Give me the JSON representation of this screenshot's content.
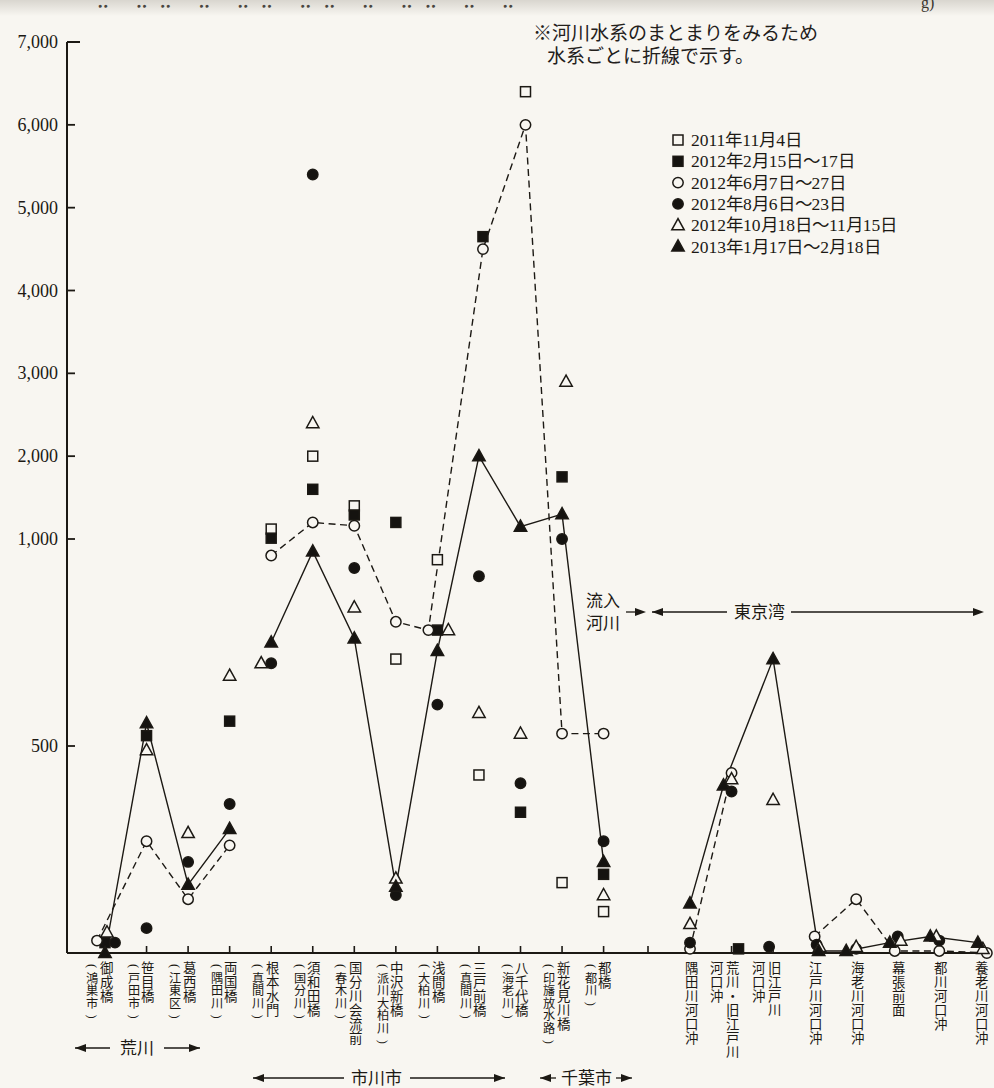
{
  "page": {
    "top_cropped_fragment_legible": "g)",
    "top_cropped_fragment_smudge": "⠤ ⠤⠤ ⠤ ⠤⠤ ⠤⠤ ⠤ ⠤⠤ ⠤ ⠤",
    "paper_color": "#f8f6f1",
    "ink_color": "#1c1914"
  },
  "note": {
    "line1": "※河川水系のまとまりをみるため",
    "line2": "水系ごとに折線で示す。"
  },
  "legend": {
    "items": [
      {
        "marker": "square-open-icon",
        "series": "sq_open",
        "label": "2011年11月4日"
      },
      {
        "marker": "square-filled-icon",
        "series": "sq_fill",
        "label": "2012年2月15日〜17日"
      },
      {
        "marker": "circle-open-icon",
        "series": "ci_open",
        "label": "2012年6月7日〜27日"
      },
      {
        "marker": "circle-filled-icon",
        "series": "ci_fill",
        "label": "2012年8月6日〜23日"
      },
      {
        "marker": "triangle-open-icon",
        "series": "tr_open",
        "label": "2012年10月18日〜11月15日"
      },
      {
        "marker": "triangle-filled-icon",
        "series": "tr_fill",
        "label": "2013年1月17日〜2月18日"
      }
    ]
  },
  "regions": {
    "arakawa": "荒川",
    "ichikawa_city": "市川市",
    "chiba_city": "千葉市",
    "inflow_line1": "流入",
    "inflow_line2": "河川",
    "tokyo_bay": "東京湾"
  },
  "chart_data": {
    "type": "scatter",
    "y_axis": {
      "ticks": [
        {
          "v": 7000,
          "label": "7,000"
        },
        {
          "v": 6000,
          "label": "6,000"
        },
        {
          "v": 5000,
          "label": "5,000"
        },
        {
          "v": 4000,
          "label": "4,000"
        },
        {
          "v": 3000,
          "label": "3,000"
        },
        {
          "v": 2000,
          "label": "2,000"
        },
        {
          "v": 1000,
          "label": "1,000"
        },
        {
          "v": 500,
          "label": "500"
        }
      ],
      "scale_note": "nonuniform: region below 1,000 is expanded",
      "ylim": [
        0,
        7000
      ],
      "grid": false
    },
    "series": [
      {
        "key": "sq_open",
        "marker": "square",
        "fill": "open",
        "label": "2011年11月4日"
      },
      {
        "key": "sq_fill",
        "marker": "square",
        "fill": "filled",
        "label": "2012年2月15日〜17日"
      },
      {
        "key": "ci_open",
        "marker": "circle",
        "fill": "open",
        "label": "2012年6月7日〜27日",
        "line": "dashed"
      },
      {
        "key": "ci_fill",
        "marker": "circle",
        "fill": "filled",
        "label": "2012年8月6日〜23日"
      },
      {
        "key": "tr_open",
        "marker": "triangle",
        "fill": "open",
        "label": "2012年10月18日〜11月15日"
      },
      {
        "key": "tr_fill",
        "marker": "triangle",
        "fill": "filled",
        "label": "2013年1月17日〜2月18日",
        "line": "solid"
      }
    ],
    "stations": [
      {
        "name": "御成橋",
        "sub": "(鴻巣市)",
        "v": {
          "sq_fill": 25,
          "ci_open": 30,
          "ci_fill": 25,
          "tr_open": 50,
          "tr_fill": 0
        },
        "dx": {
          "ci_open": -8,
          "ci_fill": 10,
          "tr_open": 2
        }
      },
      {
        "name": "笹目橋",
        "sub": "(戸田市)",
        "v": {
          "sq_fill": 525,
          "ci_open": 270,
          "ci_fill": 60,
          "tr_open": 490,
          "tr_fill": 555
        }
      },
      {
        "name": "葛西橋",
        "sub": "(江東区)",
        "v": {
          "ci_open": 130,
          "ci_fill": 220,
          "tr_open": 290,
          "tr_fill": 165
        }
      },
      {
        "name": "両国橋",
        "sub": "(隅田川)",
        "v": {
          "sq_fill": 560,
          "ci_open": 260,
          "ci_fill": 360,
          "tr_open": 670,
          "tr_fill": 300
        }
      },
      {
        "name": "根本水門",
        "sub": "(真間川)",
        "v": {
          "sq_open": 1120,
          "sq_fill": 1010,
          "ci_open": 960,
          "ci_fill": 700,
          "tr_open": 700,
          "tr_fill": 750
        },
        "dx": {
          "tr_open": -10
        }
      },
      {
        "name": "須和田橋",
        "sub": "(国分川)",
        "v": {
          "sq_open": 2000,
          "sq_fill": 1600,
          "ci_open": 1200,
          "ci_fill": 5400,
          "tr_open": 2400,
          "tr_fill": 970
        }
      },
      {
        "name": "国分川会流前",
        "sub": "(春木川)",
        "v": {
          "sq_open": 1400,
          "sq_fill": 1290,
          "ci_open": 1160,
          "ci_fill": 930,
          "tr_open": 835,
          "tr_fill": 760
        }
      },
      {
        "name": "中沢新橋",
        "sub": "(派川大柏川)",
        "v": {
          "sq_open": 710,
          "sq_fill": 1200,
          "ci_open": 800,
          "ci_fill": 140,
          "tr_open": 180,
          "tr_fill": 160
        }
      },
      {
        "name": "浅間橋",
        "sub": "(大柏川)",
        "v": {
          "sq_open": 950,
          "sq_fill": 780,
          "ci_open": 780,
          "ci_fill": 600,
          "tr_open": 780,
          "tr_fill": 730
        },
        "dx": {
          "ci_open": -9,
          "tr_open": 11
        }
      },
      {
        "name": "三戸前橋",
        "sub": "(真間川)",
        "v": {
          "sq_open": 430,
          "sq_fill": 4650,
          "ci_open": 4500,
          "ci_fill": 910,
          "tr_open": 580,
          "tr_fill": 2000
        },
        "dx": {
          "sq_fill": 4,
          "ci_open": 4
        }
      },
      {
        "name": "八千代橋",
        "sub": "(海老川)",
        "v": {
          "sq_open": 6400,
          "sq_fill": 340,
          "ci_open": 6000,
          "ci_fill": 410,
          "tr_open": 530,
          "tr_fill": 1150
        },
        "dx": {
          "sq_open": 5,
          "ci_open": 5
        }
      },
      {
        "name": "新花見川橋",
        "sub": "(印旛放水路)",
        "v": {
          "sq_open": 170,
          "sq_fill": 1750,
          "ci_open": 530,
          "ci_fill": 1000,
          "tr_open": 2900,
          "tr_fill": 1300
        },
        "dx": {
          "tr_open": 4
        }
      },
      {
        "name": "都橋",
        "sub": "(都川)",
        "v": {
          "sq_open": 100,
          "sq_fill": 190,
          "ci_open": 530,
          "ci_fill": 270,
          "tr_open": 140,
          "tr_fill": 220
        }
      },
      {
        "name": "隅田川河口沖",
        "sub": null,
        "v": {
          "ci_open": 10,
          "ci_fill": 25,
          "tr_open": 70,
          "tr_fill": 120
        }
      },
      {
        "name": "荒川・旧江戸川",
        "sub": null,
        "cont": "河口沖",
        "v": {
          "sq_fill": 10,
          "ci_open": 435,
          "ci_fill": 390,
          "tr_open": 420,
          "tr_fill": 405
        },
        "dx": {
          "tr_fill": -8,
          "sq_fill": 7
        }
      },
      {
        "name": "旧江戸川",
        "sub": null,
        "cont": "河口沖",
        "v": {
          "ci_fill": 15,
          "tr_open": 370,
          "tr_fill": 710
        },
        "dx": {
          "ci_fill": -4
        }
      },
      {
        "name": "江戸川河口沖",
        "sub": null,
        "v": {
          "ci_open": 40,
          "ci_fill": 20,
          "tr_open": 15,
          "tr_fill": 5
        },
        "dx": {
          "ci_fill": 2,
          "tr_open": 5,
          "tr_fill": 4
        }
      },
      {
        "name": "海老川河口沖",
        "sub": null,
        "v": {
          "ci_open": 130,
          "ci_fill": 10,
          "tr_open": 15,
          "tr_fill": 5
        },
        "dx": {
          "tr_fill": -10
        }
      },
      {
        "name": "幕張前面",
        "sub": null,
        "v": {
          "ci_open": 5,
          "ci_fill": 40,
          "tr_open": 30,
          "tr_fill": 25
        },
        "dx": {
          "tr_fill": -8,
          "ci_open": -3,
          "tr_open": 3
        }
      },
      {
        "name": "都川河口沖",
        "sub": null,
        "v": {
          "ci_open": 5,
          "ci_fill": 30,
          "tr_open": 40,
          "tr_fill": 40
        },
        "dx": {
          "tr_fill": -9,
          "tr_open": -3
        }
      },
      {
        "name": "養老川河口沖",
        "sub": null,
        "v": {
          "ci_open": 0,
          "tr_open": 10,
          "tr_fill": 25
        },
        "dx": {
          "ci_open": 6,
          "tr_open": 2,
          "tr_fill": -3
        }
      }
    ],
    "line_groups": {
      "tr_fill": [
        [
          1,
          2,
          3,
          4
        ],
        [
          5,
          6,
          7,
          8,
          9,
          10,
          11,
          12,
          13
        ],
        [
          14,
          15,
          16,
          17,
          18,
          19,
          20,
          21
        ]
      ],
      "ci_open": [
        [
          1,
          2,
          3,
          4
        ],
        [
          5,
          6,
          7,
          8,
          9,
          10,
          11,
          12,
          13
        ],
        [
          14,
          15
        ],
        [
          17,
          18,
          19,
          20,
          21
        ]
      ]
    }
  }
}
